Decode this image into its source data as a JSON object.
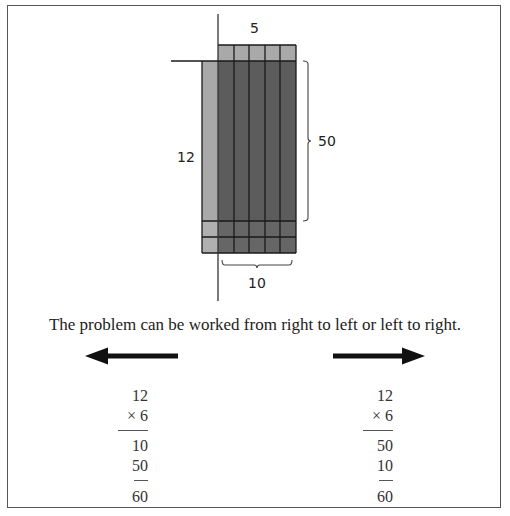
{
  "diagram": {
    "labels": {
      "top": "5",
      "left": "12",
      "right": "50",
      "bottom": "10"
    },
    "grid": {
      "columns": 5,
      "rows_total": 12,
      "tens_block": "5 x 10",
      "ones_block": "5 x 2",
      "colors": {
        "light": "#a9a9a9",
        "dark": "#5c5c5c",
        "light_bottom": "#b0b0b0",
        "dark_bottom": "#666666",
        "lines": "#1a1a1a"
      }
    }
  },
  "caption": "The problem can be worked from right to left or left to right.",
  "arrows": {
    "left": "left-arrow",
    "right": "right-arrow"
  },
  "calculations": {
    "left": {
      "multiplicand": "12",
      "multiplier": "×  6",
      "partial1": "10",
      "partial2": "50",
      "total": "60"
    },
    "right": {
      "multiplicand": "12",
      "multiplier": "×  6",
      "partial1": "50",
      "partial2": "10",
      "total": "60"
    }
  }
}
